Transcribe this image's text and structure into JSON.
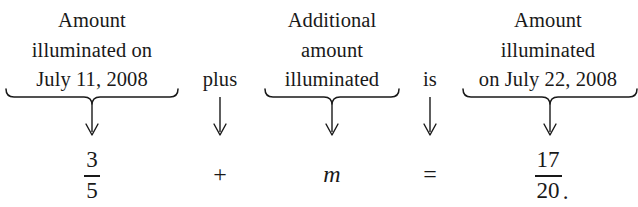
{
  "document": {
    "type": "word-equation-diagram",
    "background_color": "#ffffff",
    "text_color": "#191919"
  },
  "columns": [
    {
      "id": "left-term",
      "phrase_lines": [
        "Amount",
        "illuminated on",
        "July 11, 2008"
      ],
      "connector": "brace-arrow",
      "symbol_kind": "fraction",
      "numerator": "3",
      "denominator": "5",
      "trailing_punctuation": ""
    },
    {
      "id": "plus-operator",
      "phrase_lines": [
        "plus"
      ],
      "connector": "arrow",
      "symbol_kind": "operator",
      "operator": "+"
    },
    {
      "id": "unknown-term",
      "phrase_lines": [
        "Additional",
        "amount",
        "illuminated"
      ],
      "connector": "brace-arrow",
      "symbol_kind": "variable",
      "variable": "m"
    },
    {
      "id": "equals-operator",
      "phrase_lines": [
        "is"
      ],
      "connector": "arrow",
      "symbol_kind": "operator",
      "operator": "="
    },
    {
      "id": "right-term",
      "phrase_lines": [
        "Amount",
        "illuminated",
        "on July 22, 2008"
      ],
      "connector": "brace-arrow",
      "symbol_kind": "fraction",
      "numerator": "17",
      "denominator": "20",
      "trailing_punctuation": "."
    }
  ],
  "equation": {
    "plain_text": "3/5 + m = 17/20.",
    "word_form": "Amount illuminated on July 11, 2008 plus Additional amount illuminated is Amount illuminated on July 22, 2008"
  }
}
